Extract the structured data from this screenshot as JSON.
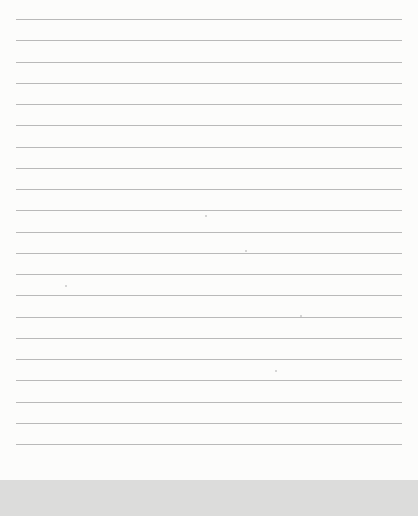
{
  "page": {
    "type": "blank lined sheet",
    "line_count": 21,
    "first_line_y": 19,
    "line_spacing": 21.25,
    "line_left": 16,
    "line_width": 386,
    "colors": {
      "paper": "#fcfcfb",
      "rule": "#b9b9b9",
      "bottom_band": "#dcdcdb"
    }
  }
}
